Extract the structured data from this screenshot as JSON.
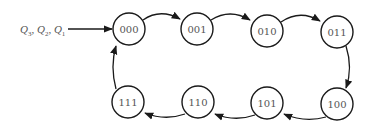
{
  "diagram": {
    "type": "state-diagram",
    "input_label": {
      "parts": [
        {
          "var": "Q",
          "sub": "3"
        },
        {
          "var": "Q",
          "sub": "2"
        },
        {
          "var": "Q",
          "sub": "1"
        }
      ],
      "separator": ", "
    },
    "states": [
      {
        "id": "s0",
        "label": "000",
        "cx": 129,
        "cy": 29
      },
      {
        "id": "s1",
        "label": "001",
        "cx": 197,
        "cy": 29
      },
      {
        "id": "s2",
        "label": "010",
        "cx": 267,
        "cy": 31
      },
      {
        "id": "s3",
        "label": "011",
        "cx": 337,
        "cy": 32
      },
      {
        "id": "s4",
        "label": "100",
        "cx": 337,
        "cy": 104
      },
      {
        "id": "s5",
        "label": "101",
        "cx": 267,
        "cy": 103
      },
      {
        "id": "s6",
        "label": "110",
        "cx": 198,
        "cy": 102
      },
      {
        "id": "s7",
        "label": "111",
        "cx": 128,
        "cy": 102
      }
    ],
    "transitions": [
      {
        "from": "000",
        "to": "001"
      },
      {
        "from": "001",
        "to": "010"
      },
      {
        "from": "010",
        "to": "011"
      },
      {
        "from": "011",
        "to": "100"
      },
      {
        "from": "100",
        "to": "101"
      },
      {
        "from": "101",
        "to": "110"
      },
      {
        "from": "110",
        "to": "111"
      },
      {
        "from": "111",
        "to": "000"
      }
    ],
    "colors": {
      "stroke": "#1a1a1a",
      "text": "#555555",
      "background": "#ffffff"
    }
  }
}
